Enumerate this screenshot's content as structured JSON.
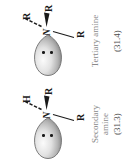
{
  "figure": {
    "orientation": "rotated-90-ccw",
    "background_color": "#ffffff",
    "ink_color": "#1a1a1a",
    "caption_color": "#8a8a8a",
    "lobe_fill_light": "#f2f2f2",
    "lobe_fill_dark": "#9a9a9a",
    "lobe_outline": "#6e6e6e"
  },
  "structures": [
    {
      "id": "secondary-amine",
      "center_atom": "N",
      "lone_pair_label": "lone-pair-lobe",
      "lone_pair_electrons": 2,
      "substituent_hashed": "H",
      "substituent_wedge": "R",
      "substituent_plain": "R",
      "caption_line1": "Secondary",
      "caption_line2": "amine",
      "equation_number": "(31.3)"
    },
    {
      "id": "tertiary-amine",
      "center_atom": "N",
      "lone_pair_label": "lone-pair-lobe",
      "lone_pair_electrons": 2,
      "substituent_hashed": "R",
      "substituent_wedge": "R",
      "substituent_plain": "R",
      "caption_line1": "Tertiary amine",
      "caption_line2": "",
      "equation_number": "(31.4)"
    }
  ]
}
